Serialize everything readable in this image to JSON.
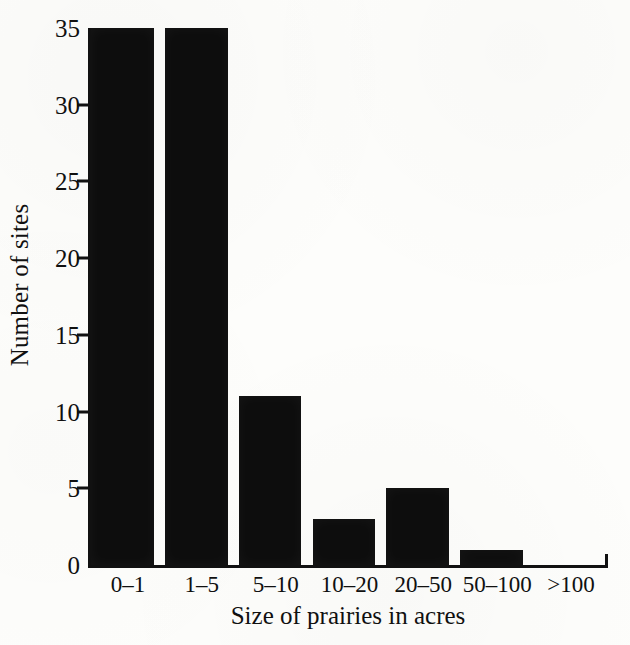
{
  "chart_data": {
    "type": "bar",
    "title": "",
    "subtitle": "",
    "xlabel": "Size of prairies in acres",
    "ylabel": "Number of sites",
    "categories": [
      "0–1",
      "1–5",
      "5–10",
      "10–20",
      "20–50",
      "50–100",
      ">100"
    ],
    "values": [
      35,
      35,
      11,
      3,
      5,
      1,
      0
    ],
    "series": [
      {
        "name": "Number of sites",
        "values": [
          35,
          35,
          11,
          3,
          5,
          1,
          0
        ]
      }
    ],
    "ylim": [
      0,
      35
    ],
    "yticks": [
      0,
      5,
      10,
      15,
      20,
      25,
      30,
      35
    ],
    "ytick_labels": [
      "0",
      "5",
      "10",
      "15",
      "20",
      "25",
      "30",
      "35"
    ],
    "xtick_labels": [
      "0–1",
      "1–5",
      "5–10",
      "10–20",
      "20–50",
      "50–100",
      ">100"
    ],
    "grid": false,
    "legend": false,
    "legend_position": "none",
    "annotations": [],
    "bar_color": "#0d0d0d",
    "axis_color": "#111111",
    "background_color": "#fdfdfb"
  }
}
